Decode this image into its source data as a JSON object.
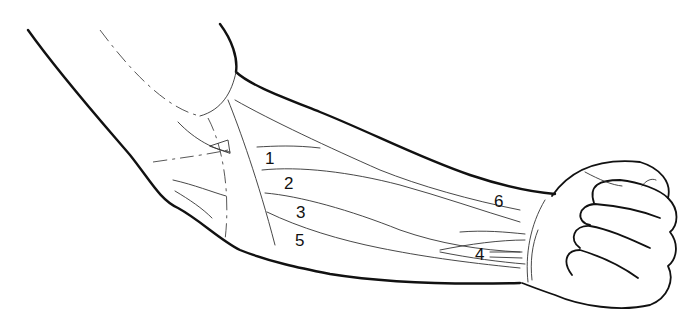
{
  "figure": {
    "line_color": "#111111",
    "background": "#ffffff"
  },
  "labels": [
    {
      "id": "1",
      "text": "1",
      "x": 265,
      "y": 150
    },
    {
      "id": "2",
      "text": "2",
      "x": 284,
      "y": 175
    },
    {
      "id": "3",
      "text": "3",
      "x": 296,
      "y": 204
    },
    {
      "id": "5",
      "text": "5",
      "x": 295,
      "y": 232
    },
    {
      "id": "6",
      "text": "6",
      "x": 494,
      "y": 193
    },
    {
      "id": "4",
      "text": "4",
      "x": 475,
      "y": 246
    }
  ]
}
